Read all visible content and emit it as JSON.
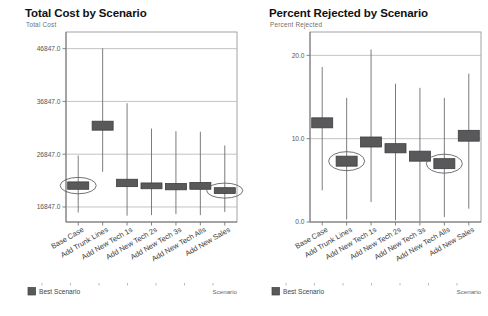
{
  "charts": [
    {
      "id": "total-cost",
      "title": "Total Cost by Scenario",
      "subtitle": "Total Cost",
      "axis_label": "Scenario",
      "legend": {
        "label": "Best Scenario",
        "color": "#59595c"
      },
      "chart_data": {
        "type": "box",
        "title": "Total Cost by Scenario",
        "ylabel": "Total Cost",
        "xlabel": "Scenario",
        "ylim": [
          14000,
          50000
        ],
        "yticks": [
          16847.0,
          26847.0,
          36847.0,
          46847.0
        ],
        "ytick_labels": [
          "16847.0",
          "26847.0",
          "36847.0",
          "46847.0"
        ],
        "grid": true,
        "legend_position": "bottom-left",
        "categories": [
          "Base Case",
          "Add Trunk Lines",
          "Add New Tech 1s",
          "Add New Tech 2s",
          "Add New Tech 3s",
          "Add New Tech Alls",
          "Add New Sales"
        ],
        "series": [
          {
            "name": "Total Cost",
            "boxes": [
              {
                "category": "Base Case",
                "low": 15800,
                "q1": 20200,
                "q3": 21600,
                "high": 26600,
                "highlighted": true
              },
              {
                "category": "Add Trunk Lines",
                "low": 23500,
                "q1": 31400,
                "q3": 33100,
                "high": 46900,
                "highlighted": false
              },
              {
                "category": "Add New Tech 1s",
                "low": 15200,
                "q1": 20700,
                "q3": 22100,
                "high": 36500,
                "highlighted": false
              },
              {
                "category": "Add New Tech 2s",
                "low": 15300,
                "q1": 20300,
                "q3": 21400,
                "high": 31700,
                "highlighted": false
              },
              {
                "category": "Add New Tech 3s",
                "low": 15500,
                "q1": 20100,
                "q3": 21300,
                "high": 31200,
                "highlighted": false
              },
              {
                "category": "Add New Tech Alls",
                "low": 15300,
                "q1": 20200,
                "q3": 21500,
                "high": 31100,
                "highlighted": false
              },
              {
                "category": "Add New Sales",
                "low": 15900,
                "q1": 19400,
                "q3": 20500,
                "high": 28500,
                "highlighted": true
              }
            ]
          }
        ]
      }
    },
    {
      "id": "percent-rejected",
      "title": "Percent Rejected by Scenario",
      "subtitle": "Percent Rejected",
      "axis_label": "Scenario",
      "legend": {
        "label": "Best Scenario",
        "color": "#59595c"
      },
      "chart_data": {
        "type": "box",
        "title": "Percent Rejected by Scenario",
        "ylabel": "Percent Rejected",
        "xlabel": "Scenario",
        "ylim": [
          0.0,
          22.8
        ],
        "yticks": [
          0.0,
          10.0,
          20.0
        ],
        "ytick_labels": [
          "0.0",
          "10.0",
          "20.0"
        ],
        "grid": true,
        "legend_position": "bottom-left",
        "categories": [
          "Base Case",
          "Add Trunk Lines",
          "Add New Tech 1s",
          "Add New Tech 2s",
          "Add New Tech 3s",
          "Add New Tech Alls",
          "Add New Sales"
        ],
        "series": [
          {
            "name": "Percent Rejected",
            "boxes": [
              {
                "category": "Base Case",
                "low": 3.8,
                "q1": 11.3,
                "q3": 12.5,
                "high": 18.6,
                "highlighted": false
              },
              {
                "category": "Add Trunk Lines",
                "low": 0.3,
                "q1": 6.7,
                "q3": 7.9,
                "high": 14.9,
                "highlighted": true
              },
              {
                "category": "Add New Tech 1s",
                "low": 2.4,
                "q1": 9.0,
                "q3": 10.2,
                "high": 20.7,
                "highlighted": false
              },
              {
                "category": "Add New Tech 2s",
                "low": 0.2,
                "q1": 8.3,
                "q3": 9.4,
                "high": 16.6,
                "highlighted": false
              },
              {
                "category": "Add New Tech 3s",
                "low": 0.1,
                "q1": 7.3,
                "q3": 8.5,
                "high": 16.1,
                "highlighted": false
              },
              {
                "category": "Add New Tech Alls",
                "low": 0.6,
                "q1": 6.4,
                "q3": 7.6,
                "high": 14.9,
                "highlighted": true
              },
              {
                "category": "Add New Sales",
                "low": 1.6,
                "q1": 9.7,
                "q3": 11.0,
                "high": 17.8,
                "highlighted": false
              }
            ]
          }
        ]
      }
    }
  ]
}
